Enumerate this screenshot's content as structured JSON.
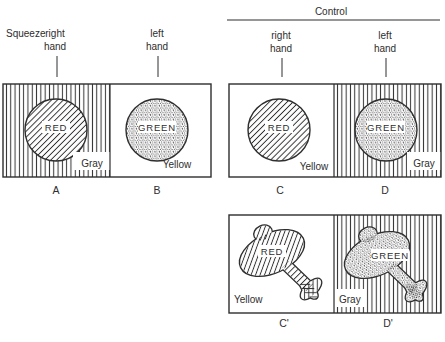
{
  "colors": {
    "ink": "#2e2e2e",
    "paper": "#ffffff"
  },
  "header": {
    "squeeze": "Squeeze",
    "control": "Control",
    "squeeze_group": {
      "right_hand": [
        "right",
        "hand"
      ],
      "left_hand": [
        "left",
        "hand"
      ]
    },
    "control_group": {
      "right_hand": [
        "right",
        "hand"
      ],
      "left_hand": [
        "left",
        "hand"
      ]
    }
  },
  "panels": {
    "a": {
      "letter": "A",
      "stimulus_word": "RED",
      "corner_word": "Gray",
      "background": "vertical-stripes",
      "shape": "circle",
      "fill_texture": "diagonal-hatch"
    },
    "b": {
      "letter": "B",
      "stimulus_word": "GREEN",
      "corner_word": "Yellow",
      "background": "plain",
      "shape": "circle",
      "fill_texture": "stipple"
    },
    "c": {
      "letter": "C",
      "stimulus_word": "RED",
      "corner_word": "Yellow",
      "background": "plain",
      "shape": "circle",
      "fill_texture": "diagonal-hatch"
    },
    "d": {
      "letter": "D",
      "stimulus_word": "GREEN",
      "corner_word": "Gray",
      "background": "vertical-stripes",
      "shape": "circle",
      "fill_texture": "stipple"
    },
    "c_prime": {
      "letter": "C'",
      "stimulus_word": "RED",
      "corner_word": "Yellow",
      "background": "plain",
      "shape": "airplane",
      "fill_texture": "diagonal-hatch"
    },
    "d_prime": {
      "letter": "D'",
      "stimulus_word": "GREEN",
      "corner_word": "Gray",
      "background": "vertical-stripes",
      "shape": "airplane",
      "fill_texture": "stipple"
    }
  }
}
